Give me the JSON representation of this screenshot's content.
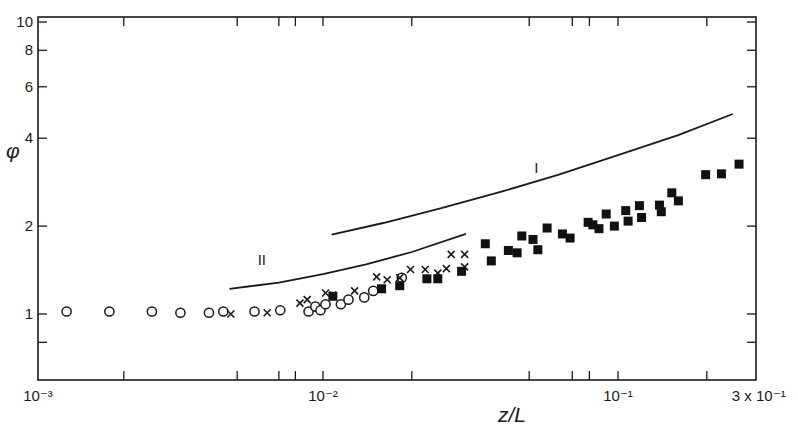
{
  "chart_data": {
    "type": "scatter",
    "title": "",
    "xlabel": "z/L",
    "ylabel": "φ",
    "xscale": "log",
    "yscale": "log",
    "xlim": [
      0.001,
      0.3
    ],
    "ylim": [
      0.55,
      10
    ],
    "grid": false,
    "legend": null,
    "x_ticks": [
      {
        "value": 0.001,
        "label": "10⁻³"
      },
      {
        "value": 0.002,
        "label": ""
      },
      {
        "value": 0.005,
        "label": ""
      },
      {
        "value": 0.007,
        "label": ""
      },
      {
        "value": 0.008,
        "label": ""
      },
      {
        "value": 0.01,
        "label": "10⁻²"
      },
      {
        "value": 0.02,
        "label": ""
      },
      {
        "value": 0.05,
        "label": ""
      },
      {
        "value": 0.07,
        "label": ""
      },
      {
        "value": 0.08,
        "label": ""
      },
      {
        "value": 0.1,
        "label": "10⁻¹"
      },
      {
        "value": 0.2,
        "label": ""
      },
      {
        "value": 0.3,
        "label": "3 x 10⁻¹"
      }
    ],
    "y_ticks": [
      {
        "value": 0.8,
        "label": ""
      },
      {
        "value": 1,
        "label": "1"
      },
      {
        "value": 2,
        "label": "2"
      },
      {
        "value": 4,
        "label": "4"
      },
      {
        "value": 6,
        "label": "6"
      },
      {
        "value": 8,
        "label": "8"
      },
      {
        "value": 10,
        "label": "10"
      }
    ],
    "series": [
      {
        "name": "open circles",
        "marker": "circle-open",
        "points": [
          [
            0.00126,
            1.02
          ],
          [
            0.00178,
            1.02
          ],
          [
            0.00251,
            1.02
          ],
          [
            0.00316,
            1.01
          ],
          [
            0.00398,
            1.01
          ],
          [
            0.00447,
            1.02
          ],
          [
            0.00575,
            1.02
          ],
          [
            0.00708,
            1.03
          ],
          [
            0.0089,
            1.02
          ],
          [
            0.0094,
            1.06
          ],
          [
            0.0098,
            1.03
          ],
          [
            0.0102,
            1.08
          ],
          [
            0.0115,
            1.08
          ],
          [
            0.0122,
            1.12
          ],
          [
            0.0138,
            1.14
          ],
          [
            0.0148,
            1.2
          ],
          [
            0.0185,
            1.33
          ]
        ]
      },
      {
        "name": "crosses",
        "marker": "cross",
        "points": [
          [
            0.00475,
            1.0
          ],
          [
            0.00637,
            1.01
          ],
          [
            0.0083,
            1.09
          ],
          [
            0.0088,
            1.12
          ],
          [
            0.0102,
            1.18
          ],
          [
            0.0108,
            1.16
          ],
          [
            0.0128,
            1.2
          ],
          [
            0.0152,
            1.34
          ],
          [
            0.0165,
            1.31
          ],
          [
            0.0182,
            1.33
          ],
          [
            0.0198,
            1.42
          ],
          [
            0.0222,
            1.42
          ],
          [
            0.0245,
            1.38
          ],
          [
            0.0262,
            1.43
          ],
          [
            0.0272,
            1.6
          ],
          [
            0.0302,
            1.6
          ],
          [
            0.0302,
            1.45
          ]
        ]
      },
      {
        "name": "filled squares",
        "marker": "square-filled",
        "points": [
          [
            0.0108,
            1.15
          ],
          [
            0.0158,
            1.22
          ],
          [
            0.0182,
            1.25
          ],
          [
            0.0225,
            1.32
          ],
          [
            0.0245,
            1.32
          ],
          [
            0.0295,
            1.4
          ],
          [
            0.0355,
            1.74
          ],
          [
            0.0372,
            1.52
          ],
          [
            0.0425,
            1.65
          ],
          [
            0.0455,
            1.62
          ],
          [
            0.0472,
            1.85
          ],
          [
            0.0515,
            1.8
          ],
          [
            0.0535,
            1.66
          ],
          [
            0.0575,
            1.97
          ],
          [
            0.0648,
            1.88
          ],
          [
            0.0688,
            1.82
          ],
          [
            0.0792,
            2.06
          ],
          [
            0.0822,
            2.02
          ],
          [
            0.0862,
            1.96
          ],
          [
            0.0912,
            2.2
          ],
          [
            0.0972,
            2.0
          ],
          [
            0.1062,
            2.26
          ],
          [
            0.1082,
            2.08
          ],
          [
            0.1182,
            2.35
          ],
          [
            0.1202,
            2.14
          ],
          [
            0.1382,
            2.36
          ],
          [
            0.1402,
            2.24
          ],
          [
            0.1522,
            2.6
          ],
          [
            0.1602,
            2.44
          ],
          [
            0.1982,
            3.0
          ],
          [
            0.2242,
            3.02
          ],
          [
            0.2572,
            3.26
          ]
        ]
      }
    ],
    "curves": [
      {
        "name": "I",
        "label": "I",
        "points": [
          [
            0.0107,
            1.87
          ],
          [
            0.016,
            2.05
          ],
          [
            0.025,
            2.3
          ],
          [
            0.04,
            2.62
          ],
          [
            0.063,
            3.0
          ],
          [
            0.1,
            3.5
          ],
          [
            0.16,
            4.1
          ],
          [
            0.245,
            4.84
          ]
        ],
        "label_at": [
          0.052,
          3.05
        ]
      },
      {
        "name": "II",
        "label": "II",
        "points": [
          [
            0.0047,
            1.22
          ],
          [
            0.007,
            1.28
          ],
          [
            0.01,
            1.37
          ],
          [
            0.014,
            1.48
          ],
          [
            0.02,
            1.63
          ],
          [
            0.0305,
            1.88
          ]
        ],
        "label_at": [
          0.0059,
          1.47
        ]
      }
    ]
  }
}
